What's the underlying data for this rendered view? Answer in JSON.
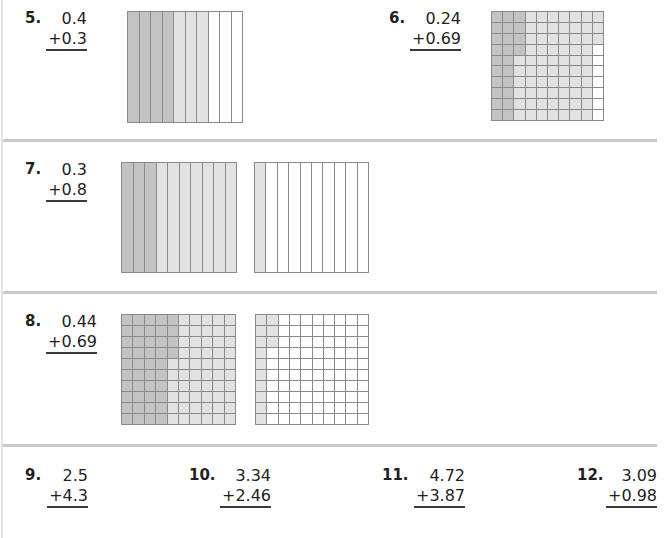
{
  "colors": {
    "dark_shade": "#c3c3c3",
    "light_shade": "#e2e2e2",
    "empty": "#ffffff",
    "grid_line": "#8a8a8a"
  },
  "problems": [
    {
      "number": "5.",
      "top": "0.4",
      "bottom": "+0.3",
      "models": [
        {
          "type": "tenths",
          "dark": 4,
          "light": 3
        }
      ]
    },
    {
      "number": "6.",
      "top": "0.24",
      "bottom": "+0.69",
      "models": [
        {
          "type": "hundredths",
          "dark": 24,
          "light": 69
        }
      ]
    },
    {
      "number": "7.",
      "top": "0.3",
      "bottom": "+0.8",
      "models": [
        {
          "type": "tenths",
          "dark": 3,
          "light": 7
        },
        {
          "type": "tenths",
          "dark": 0,
          "light": 1
        }
      ]
    },
    {
      "number": "8.",
      "top": "0.44",
      "bottom": "+0.69",
      "models": [
        {
          "type": "hundredths",
          "dark": 44,
          "light": 56
        },
        {
          "type": "hundredths",
          "dark": 0,
          "light": 13
        }
      ]
    },
    {
      "number": "9.",
      "top": "2.5",
      "bottom": "+4.3"
    },
    {
      "number": "10.",
      "top": "3.34",
      "bottom": "+2.46"
    },
    {
      "number": "11.",
      "top": "4.72",
      "bottom": "+3.87"
    },
    {
      "number": "12.",
      "top": "3.09",
      "bottom": "+0.98"
    }
  ]
}
